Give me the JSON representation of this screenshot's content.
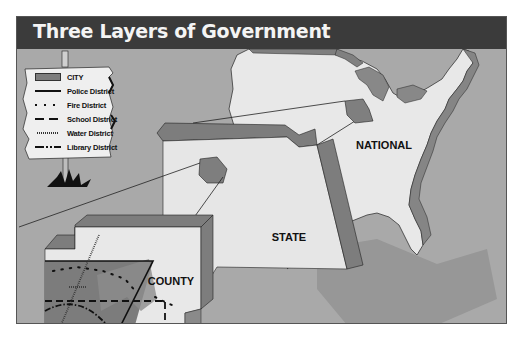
{
  "title": "Three Layers of Government",
  "levels": {
    "national": "NATIONAL",
    "state": "STATE",
    "county": "COUNTY"
  },
  "legend": {
    "items": [
      {
        "label": "CITY",
        "symbol": "gray-filled-rectangle"
      },
      {
        "label": "Police District",
        "symbol": "solid-line"
      },
      {
        "label": "Fire District",
        "symbol": "dotted-line"
      },
      {
        "label": "School District",
        "symbol": "dashed-line"
      },
      {
        "label": "Water District",
        "symbol": "fine-hatched-line"
      },
      {
        "label": "Library District",
        "symbol": "dash-dot-line"
      }
    ]
  },
  "colors": {
    "title_bar": "#3b3b3b",
    "title_text": "#f4f4f4",
    "background": "#a9a9a9",
    "land": "#e6e6e6",
    "extrusion": "#808080",
    "city": "#7e7e7e"
  }
}
